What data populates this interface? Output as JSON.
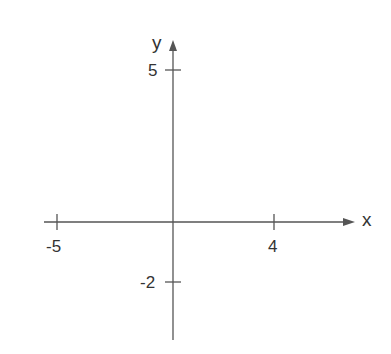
{
  "diagram": {
    "type": "coordinate-axes",
    "x_axis_label": "x",
    "y_axis_label": "y",
    "ticks": {
      "x_negative": "-5",
      "x_positive": "4",
      "y_positive": "5",
      "y_negative": "-2"
    },
    "line_color": "#555555",
    "text_color": "#333333"
  }
}
